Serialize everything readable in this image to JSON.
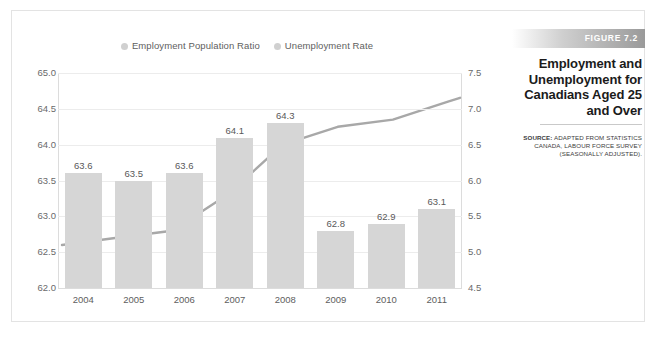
{
  "figure": {
    "banner_label": "FIGURE 7.2",
    "title": "Employment and Unemployment for Canadians Aged 25 and Over",
    "source_lead": "SOURCE:",
    "source_text": " ADAPTED FROM STATISTICS CANADA, LABOUR FORCE SURVEY (SEASONALLY ADJUSTED)."
  },
  "colors": {
    "bar": "#d6d6d6",
    "line": "#a8a8a8",
    "grid": "#ececec",
    "axis_text": "#6a6a6a",
    "banner_start": "#ffffff",
    "banner_end": "#9a9a9a"
  },
  "chart_data": {
    "type": "bar",
    "title": "Employment and Unemployment for Canadians Aged 25 and Over",
    "xlabel": "",
    "ylabel": "",
    "grid": true,
    "legend_position": "top-center",
    "categories": [
      "2004",
      "2005",
      "2006",
      "2007",
      "2008",
      "2009",
      "2010",
      "2011"
    ],
    "series": [
      {
        "name": "Employment Population Ratio",
        "type": "bar",
        "axis": "left",
        "values": [
          63.6,
          63.5,
          63.6,
          64.1,
          64.3,
          62.8,
          62.9,
          63.1
        ],
        "labels": [
          "63.6",
          "63.5",
          "63.6",
          "64.1",
          "64.3",
          "62.8",
          "62.9",
          "63.1"
        ],
        "color": "#d6d6d6"
      },
      {
        "name": "Unemployment Rate",
        "type": "line",
        "axis": "right",
        "values": [
          5.1,
          5.2,
          5.3,
          5.8,
          6.5,
          6.75,
          6.85,
          7.1
        ],
        "color": "#a8a8a8"
      }
    ],
    "y_left": {
      "ticks": [
        "65.0",
        "64.5",
        "64.0",
        "63.5",
        "63.0",
        "62.5",
        "62.0"
      ],
      "values": [
        65.0,
        64.5,
        64.0,
        63.5,
        63.0,
        62.5,
        62.0
      ],
      "ylim": [
        62.0,
        65.0
      ]
    },
    "y_right": {
      "ticks": [
        "7.5",
        "7.0",
        "6.5",
        "6.0",
        "5.5",
        "5.0",
        "4.5"
      ],
      "values": [
        7.5,
        7.0,
        6.5,
        6.0,
        5.5,
        5.0,
        4.5
      ],
      "ylim": [
        4.5,
        7.5
      ]
    },
    "legend": [
      {
        "label": "Employment Population Ratio",
        "marker": "circle",
        "color": "#d0d0d0"
      },
      {
        "label": "Unemployment Rate",
        "marker": "circle",
        "color": "#d0d0d0"
      }
    ]
  }
}
